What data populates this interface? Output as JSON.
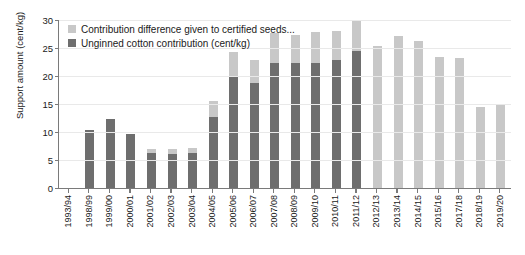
{
  "chart_data": {
    "type": "bar",
    "title": "",
    "xlabel": "",
    "ylabel": "Support amount (cent/kg)",
    "ylim": [
      0,
      30
    ],
    "yticks": [
      0,
      5,
      10,
      15,
      20,
      25,
      30
    ],
    "grid": true,
    "stacked": true,
    "legend_position": "top-left",
    "categories": [
      "1993/94",
      "1998/99",
      "1999/00",
      "2000/01",
      "2001/02",
      "2002/03",
      "2003/04",
      "2004/05",
      "2005/06",
      "2006/07",
      "2007/08",
      "2008/09",
      "2009/10",
      "2010/11",
      "2011/12",
      "2012/13",
      "2013/14",
      "2014/15",
      "2015/16",
      "2017/18",
      "2018/19",
      "2019/20"
    ],
    "series": [
      {
        "name": "Unginned cotton contribution (cent/kg)",
        "color": "#6e6e6e",
        "values": [
          0,
          10.4,
          12.3,
          9.7,
          6.3,
          6.1,
          6.3,
          12.6,
          20.0,
          18.8,
          22.4,
          22.4,
          22.4,
          22.8,
          24.5,
          0,
          0,
          0,
          0,
          0,
          0,
          0
        ]
      },
      {
        "name": "Contribution difference given to certified seeds...",
        "color": "#c8c8c8",
        "values": [
          0,
          0,
          0,
          0,
          0.7,
          0.9,
          0.8,
          3.0,
          4.2,
          4.1,
          5.2,
          5.0,
          5.5,
          5.2,
          5.5,
          25.4,
          27.2,
          26.2,
          23.4,
          23.3,
          14.4,
          15.0
        ]
      }
    ],
    "totals": [
      0,
      10.4,
      12.3,
      9.7,
      7.0,
      7.0,
      7.1,
      15.6,
      24.2,
      22.9,
      27.6,
      27.4,
      27.9,
      28.0,
      30.0,
      25.4,
      27.2,
      26.2,
      23.4,
      23.3,
      14.4,
      15.0
    ],
    "axis_color": "#7a7a7a",
    "grid_color": "#e9e9e9",
    "background": "#ffffff"
  },
  "legend": {
    "items": [
      {
        "label": "Contribution difference given to certified seeds...",
        "color": "#c8c8c8"
      },
      {
        "label": "Unginned cotton contribution (cent/kg)",
        "color": "#6e6e6e"
      }
    ]
  }
}
